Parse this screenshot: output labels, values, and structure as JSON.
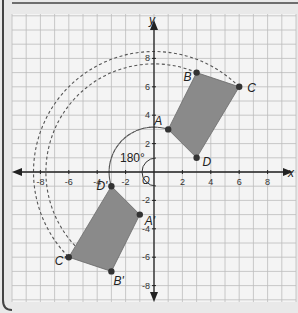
{
  "axes": {
    "x_label": "x",
    "y_label": "y",
    "origin_label": "O",
    "x_ticks": [
      {
        "value": -8,
        "label": "-8"
      },
      {
        "value": -6,
        "label": "-6"
      },
      {
        "value": -4,
        "label": "-4"
      },
      {
        "value": -2,
        "label": "-2"
      },
      {
        "value": 2,
        "label": "2"
      },
      {
        "value": 4,
        "label": "4"
      },
      {
        "value": 6,
        "label": "6"
      },
      {
        "value": 8,
        "label": "8"
      }
    ],
    "y_ticks": [
      {
        "value": 8,
        "label": "8"
      },
      {
        "value": 6,
        "label": "6"
      },
      {
        "value": 4,
        "label": "4"
      },
      {
        "value": 2,
        "label": "2"
      },
      {
        "value": -2,
        "label": "-2"
      },
      {
        "value": -4,
        "label": "-4"
      },
      {
        "value": -6,
        "label": "-6"
      },
      {
        "value": -8,
        "label": "-8"
      }
    ]
  },
  "angle_label": "180°",
  "shapes": {
    "original": {
      "name": "ABCD",
      "fill": "#8a8a8a",
      "points": [
        {
          "label": "A",
          "x": 1,
          "y": 3
        },
        {
          "label": "B",
          "x": 3,
          "y": 7
        },
        {
          "label": "C",
          "x": 6,
          "y": 6
        },
        {
          "label": "D",
          "x": 3,
          "y": 1
        }
      ]
    },
    "image": {
      "name": "A'B'C'D'",
      "fill": "#8a8a8a",
      "points": [
        {
          "label": "A'",
          "x": -1,
          "y": -3
        },
        {
          "label": "B'",
          "x": -3,
          "y": -7
        },
        {
          "label": "C'",
          "x": -6,
          "y": -6
        },
        {
          "label": "D'",
          "x": -3,
          "y": -1
        }
      ]
    }
  },
  "colors": {
    "grid": "#bdbdbd",
    "axis": "#222222",
    "shape": "#8a8a8a",
    "point": "#333333",
    "background": "#f4f4f4"
  }
}
